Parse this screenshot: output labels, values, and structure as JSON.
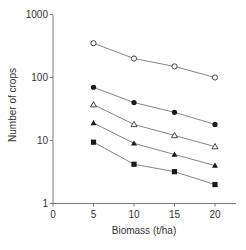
{
  "chart_data": {
    "type": "line",
    "title": "",
    "xlabel": "Biomass (t/ha)",
    "ylabel": "Number of crops",
    "xscale": "linear",
    "yscale": "log",
    "xlim": [
      0,
      22
    ],
    "ylim": [
      1,
      1000
    ],
    "x_ticks": [
      0,
      5,
      10,
      15,
      20
    ],
    "y_ticks": [
      1,
      10,
      100,
      1000
    ],
    "x_tick_labels": [
      "0",
      "5",
      "10",
      "15",
      "20"
    ],
    "y_tick_labels": [
      "1",
      "10",
      "100",
      "1000"
    ],
    "grid": false,
    "legend": null,
    "x": [
      5,
      10,
      15,
      20
    ],
    "series": [
      {
        "name": "open-circle",
        "marker": "circle-open",
        "values": [
          350,
          200,
          150,
          100
        ]
      },
      {
        "name": "filled-circle",
        "marker": "circle-filled",
        "values": [
          70,
          40,
          28,
          18
        ]
      },
      {
        "name": "open-triangle",
        "marker": "triangle-open",
        "values": [
          37,
          18,
          12,
          8
        ]
      },
      {
        "name": "filled-triangle",
        "marker": "triangle-filled",
        "values": [
          19,
          9,
          6,
          4
        ]
      },
      {
        "name": "filled-square",
        "marker": "square-filled",
        "values": [
          9.4,
          4.2,
          3.2,
          2
        ]
      }
    ]
  },
  "colors": {
    "axis": "#7a7a7a",
    "line": "#777777",
    "marker": "#1a1a1a",
    "text": "#333333"
  }
}
